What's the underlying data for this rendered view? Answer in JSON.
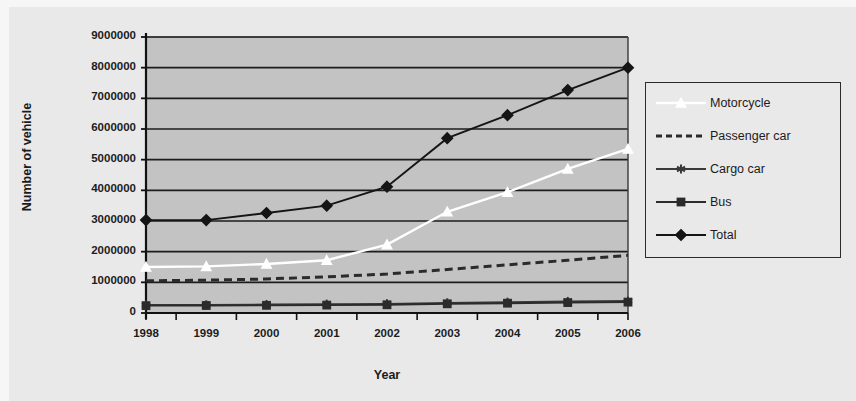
{
  "chart_data": {
    "type": "line",
    "title": "",
    "xlabel": "Year",
    "ylabel": "Number of vehicle",
    "categories": [
      "1998",
      "1999",
      "2000",
      "2001",
      "2002",
      "2003",
      "2004",
      "2005",
      "2006"
    ],
    "x": [
      1998,
      1999,
      2000,
      2001,
      2002,
      2003,
      2004,
      2005,
      2006
    ],
    "ylim": [
      0,
      9000000
    ],
    "xlim": [
      1998,
      2006
    ],
    "ytick_labels": [
      "9000000",
      "8000000",
      "7000000",
      "6000000",
      "5000000",
      "4000000",
      "3000000",
      "2000000",
      "1000000",
      "0"
    ],
    "ytick_values": [
      9000000,
      8000000,
      7000000,
      6000000,
      5000000,
      4000000,
      3000000,
      2000000,
      1000000,
      0
    ],
    "ytick_step": 1000000,
    "grid": "horizontal",
    "legend_position": "right",
    "plot_background": "#c3c3c3",
    "figure_background": "#e9e9e9",
    "series": [
      {
        "name": "Motorcycle",
        "color": "#ffffff",
        "marker": "triangle",
        "line_style": "solid",
        "values": [
          1500000,
          1520000,
          1600000,
          1720000,
          2230000,
          3300000,
          3940000,
          4700000,
          5350000
        ]
      },
      {
        "name": "Passenger car",
        "color": "#2b2b2b",
        "marker": "none",
        "line_style": "dashed",
        "values": [
          1050000,
          1070000,
          1110000,
          1180000,
          1270000,
          1420000,
          1570000,
          1720000,
          1880000
        ]
      },
      {
        "name": "Cargo car",
        "color": "#3a3a3a",
        "marker": "asterisk",
        "line_style": "solid",
        "values": [
          260000,
          265000,
          275000,
          285000,
          295000,
          330000,
          350000,
          375000,
          390000
        ]
      },
      {
        "name": "Bus",
        "color": "#2b2b2b",
        "marker": "square",
        "line_style": "solid",
        "values": [
          240000,
          245000,
          250000,
          258000,
          268000,
          300000,
          320000,
          340000,
          355000
        ]
      },
      {
        "name": "Total",
        "color": "#151515",
        "marker": "diamond",
        "line_style": "solid",
        "values": [
          3030000,
          3030000,
          3260000,
          3500000,
          4120000,
          5700000,
          6450000,
          7270000,
          8000000
        ]
      }
    ]
  },
  "legend": {
    "entries": [
      {
        "label": "Motorcycle",
        "key": "white-line-triangle-marker"
      },
      {
        "label": "Passenger car",
        "key": "dashed-line"
      },
      {
        "label": "Cargo car",
        "key": "line-asterisk-marker"
      },
      {
        "label": "Bus",
        "key": "line-square-marker"
      },
      {
        "label": "Total",
        "key": "line-diamond-marker"
      }
    ]
  }
}
